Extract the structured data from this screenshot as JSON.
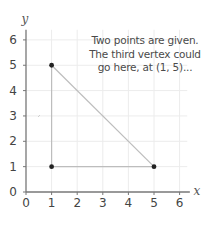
{
  "chart_data": {
    "type": "scatter",
    "title": "",
    "xlabel": "x",
    "ylabel": "y",
    "xlim": [
      0,
      6
    ],
    "ylim": [
      0,
      6
    ],
    "x_ticks": [
      "0",
      "1",
      "2",
      "3",
      "4",
      "5",
      "6"
    ],
    "y_ticks": [
      "0",
      "1",
      "2",
      "3",
      "4",
      "5",
      "6"
    ],
    "grid": true,
    "points": [
      {
        "x": 1,
        "y": 5,
        "label": "third vertex"
      },
      {
        "x": 1,
        "y": 1,
        "label": "given point"
      },
      {
        "x": 5,
        "y": 1,
        "label": "given point"
      }
    ],
    "polygon": [
      [
        1,
        5
      ],
      [
        1,
        1
      ],
      [
        5,
        1
      ]
    ],
    "annotations": [
      "Two points are given.",
      "The third vertex could",
      "go here, at (1, 5)..."
    ]
  },
  "axes": {
    "x_label": "x",
    "y_label": "y"
  },
  "annotation": {
    "line1": "Two points are given.",
    "line2": "The third vertex could",
    "line3": "go here, at (1, 5)..."
  },
  "colors": {
    "axis": "#777777",
    "grid": "#ececec",
    "edge": "#bdbdbd",
    "point": "#222222",
    "text": "#444444"
  }
}
